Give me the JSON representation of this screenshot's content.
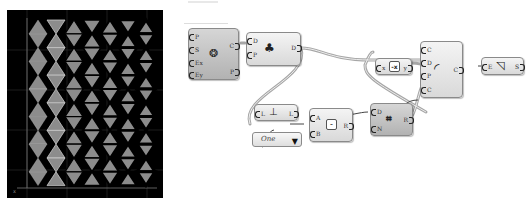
{
  "viewport": {
    "name": "rhino-viewport",
    "background": "#000000",
    "grid_color": "#3a3a3a",
    "triangle_fill": "#8c8c8c",
    "rows": 6,
    "cols": 7,
    "axis_label": "x"
  },
  "canvas": {
    "top_faint_group": "Group",
    "nodes": {
      "pattern": {
        "inputs": [
          "P",
          "S",
          "Ex",
          "Ey"
        ],
        "outputs": [
          "C",
          "P"
        ],
        "icon": "hexagon-grid-icon"
      },
      "deconstruct": {
        "inputs": [
          "D",
          "P"
        ],
        "outputs": [
          "D"
        ],
        "icon": "explode-icon"
      },
      "list_length": {
        "inputs": [
          "L"
        ],
        "outputs": [
          "L"
        ],
        "icon": "list-length-icon"
      },
      "dropdown": {
        "value": "One",
        "arrow": "▼"
      },
      "subtraction": {
        "inputs": [
          "A",
          "B"
        ],
        "outputs": [
          "R"
        ],
        "symbol": "-"
      },
      "expression": {
        "inputs": [
          "x"
        ],
        "outputs": [
          "y"
        ],
        "symbol": "-x"
      },
      "series": {
        "inputs": [
          "D",
          "N"
        ],
        "outputs": [
          "R"
        ],
        "icon": "series-icon"
      },
      "offset_curve": {
        "inputs": [
          "C",
          "D",
          "P",
          "C"
        ],
        "outputs": [
          "C"
        ],
        "icon": "offset-icon"
      },
      "surface": {
        "inputs": [
          "E"
        ],
        "outputs": [
          "S"
        ],
        "icon": "surface-icon"
      }
    },
    "wire_color": "#a6a6a6"
  }
}
